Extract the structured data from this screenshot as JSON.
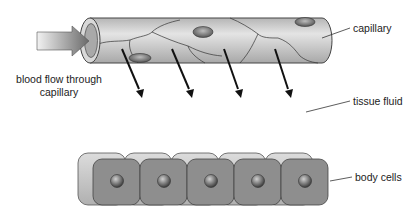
{
  "labels": {
    "capillary": "capillary",
    "blood_flow_line1": "blood flow through",
    "blood_flow_line2": "capillary",
    "tissue_fluid": "tissue fluid",
    "body_cells": "body cells"
  },
  "diagram": {
    "capillary_color": "#c9c9c9",
    "cell_color": "#8e8e8e",
    "arrow_color": "#111111",
    "fluid_arrow_count": 4,
    "body_cell_count": 5
  }
}
